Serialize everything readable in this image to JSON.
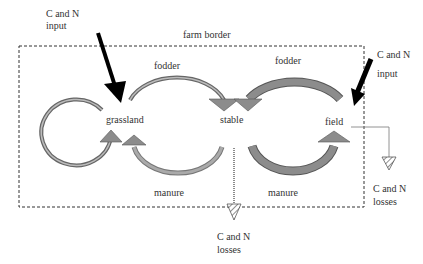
{
  "diagram": {
    "border_label": "farm border",
    "nodes": {
      "grassland": "grassland",
      "stable": "stable",
      "field": "field"
    },
    "flows": {
      "fodder_left": "fodder",
      "fodder_right": "fodder",
      "manure_left": "manure",
      "manure_right": "manure"
    },
    "inputs": {
      "left": "C and N\ninput",
      "right_line1": "C and N",
      "right_line2": "input"
    },
    "losses": {
      "stable_line1": "C and N",
      "stable_line2": "losses",
      "field_line1": "C and N",
      "field_line2": "losses"
    },
    "colors": {
      "arrow_fill": "#8c8c8c",
      "arrow_outline": "#555555",
      "input_arrow": "#000000",
      "border": "#333333"
    }
  }
}
